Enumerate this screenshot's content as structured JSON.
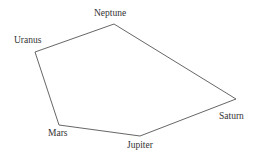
{
  "diagram": {
    "type": "polygon",
    "stroke_color": "#555555",
    "nodes": [
      {
        "label": "Neptune",
        "x": 114,
        "y": 24
      },
      {
        "label": "Saturn",
        "x": 236,
        "y": 99
      },
      {
        "label": "Jupiter",
        "x": 140,
        "y": 136
      },
      {
        "label": "Mars",
        "x": 59,
        "y": 125
      },
      {
        "label": "Uranus",
        "x": 35,
        "y": 52
      }
    ]
  },
  "labels": {
    "neptune": "Neptune",
    "uranus": "Uranus",
    "mars": "Mars",
    "jupiter": "Jupiter",
    "saturn": "Saturn"
  }
}
